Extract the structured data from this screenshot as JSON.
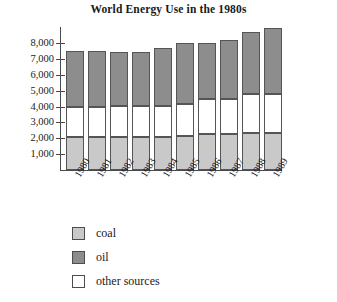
{
  "chart_data": {
    "type": "bar",
    "subtype": "stacked-vertical",
    "title": "World Energy Use in the 1980s",
    "xlabel": "",
    "ylabel": "",
    "grid": false,
    "legend_position": "below",
    "ylim": [
      0,
      9200
    ],
    "yticks": [
      1000,
      2000,
      3000,
      4000,
      5000,
      6000,
      7000,
      8000
    ],
    "ytick_labels": [
      "1,000",
      "2,000",
      "3,000",
      "4,000",
      "5,000",
      "6,000",
      "7,000",
      "8,000"
    ],
    "categories": [
      "1980",
      "1981",
      "1982",
      "1983",
      "1984",
      "1985",
      "1986",
      "1987",
      "1988",
      "1989"
    ],
    "series": [
      {
        "name": "coal",
        "color": "#c9c9c9",
        "values": [
          2100,
          2100,
          2100,
          2100,
          2100,
          2150,
          2250,
          2250,
          2300,
          2300
        ]
      },
      {
        "name": "other sources",
        "color": "#ffffff",
        "values": [
          1900,
          1900,
          1900,
          1900,
          1950,
          2000,
          2200,
          2250,
          2500,
          2500
        ]
      },
      {
        "name": "oil",
        "color": "#8d8d8d",
        "values": [
          3500,
          3500,
          3450,
          3450,
          3650,
          3850,
          3550,
          3700,
          3900,
          4150
        ]
      }
    ],
    "totals": [
      7500,
      7500,
      7450,
      7450,
      7700,
      8000,
      8000,
      8200,
      8700,
      8950
    ],
    "stack_order_bottom_to_top": [
      "coal",
      "other sources",
      "oil"
    ]
  },
  "legend": {
    "items": [
      {
        "label": "coal",
        "color": "#c9c9c9"
      },
      {
        "label": "oil",
        "color": "#8d8d8d"
      },
      {
        "label": "other sources",
        "color": "#ffffff"
      }
    ]
  }
}
